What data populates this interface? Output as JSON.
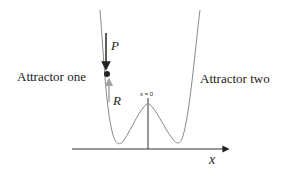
{
  "diagram": {
    "type": "double-well potential",
    "labels": {
      "left_attractor": "Attractor one",
      "right_attractor": "Attractor two",
      "origin": "x = 0",
      "x_axis": "x",
      "perturbation": "P",
      "restoring": "R"
    },
    "colors": {
      "curve": "#8a8a8a",
      "axis": "#333333",
      "ball": "#222222",
      "arrow_p": "#333333",
      "arrow_r": "#a0a0a0"
    }
  }
}
